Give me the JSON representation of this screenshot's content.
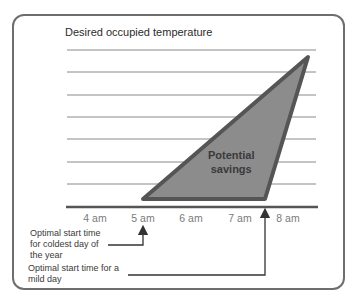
{
  "diagram": {
    "title": "Desired occupied temperature",
    "region_label_line1": "Potential",
    "region_label_line2": "savings",
    "time_axis": [
      "4 am",
      "5 am",
      "6 am",
      "7 am",
      "8 am"
    ],
    "annotations": {
      "coldest_day": [
        "Optimal start time",
        "for coldest day of",
        "the year"
      ],
      "mild_day": [
        "Optimal start time for a",
        "mild day"
      ]
    },
    "colors": {
      "fill": "#8c8c8c",
      "stroke": "#555555",
      "gridline": "#8a8a8a",
      "frame": "#6e6e6e"
    }
  }
}
